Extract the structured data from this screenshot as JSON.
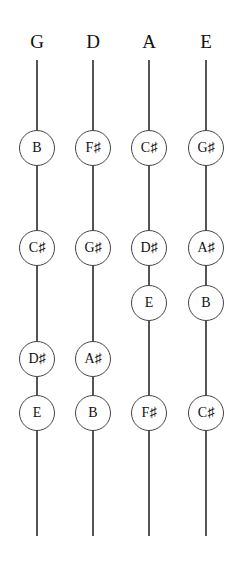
{
  "strings": [
    {
      "name": "G",
      "x": 37,
      "notes": [
        {
          "label": "B",
          "y": 148
        },
        {
          "label": "C♯",
          "y": 248
        },
        {
          "label": "D♯",
          "y": 359
        },
        {
          "label": "E",
          "y": 413
        }
      ]
    },
    {
      "name": "D",
      "x": 93,
      "notes": [
        {
          "label": "F♯",
          "y": 148
        },
        {
          "label": "G♯",
          "y": 248
        },
        {
          "label": "A♯",
          "y": 359
        },
        {
          "label": "B",
          "y": 413
        }
      ]
    },
    {
      "name": "A",
      "x": 149,
      "notes": [
        {
          "label": "C♯",
          "y": 148
        },
        {
          "label": "D♯",
          "y": 248
        },
        {
          "label": "E",
          "y": 303
        },
        {
          "label": "F♯",
          "y": 413
        }
      ]
    },
    {
      "name": "E",
      "x": 206,
      "notes": [
        {
          "label": "G♯",
          "y": 148
        },
        {
          "label": "A♯",
          "y": 248
        },
        {
          "label": "B",
          "y": 303
        },
        {
          "label": "C♯",
          "y": 413
        }
      ]
    }
  ]
}
